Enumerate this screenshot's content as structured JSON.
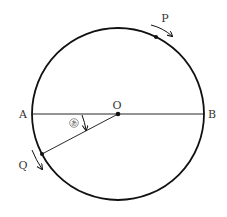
{
  "diagram": {
    "type": "circle-motion",
    "colors": {
      "stroke": "#111111",
      "label": "#333333",
      "background": "#ffffff"
    },
    "circle": {
      "cx": 118,
      "cy": 114,
      "r": 86
    },
    "center": {
      "label": "O",
      "x": 118,
      "y": 114
    },
    "points": {
      "A": {
        "label": "A",
        "x": 32,
        "y": 114
      },
      "B": {
        "label": "B",
        "x": 204,
        "y": 114
      },
      "P": {
        "label": "P",
        "x": 157,
        "y": 37,
        "direction": "clockwise"
      },
      "Q": {
        "label": "Q",
        "x": 42,
        "y": 154,
        "direction": "counterclockwise"
      }
    },
    "segments": [
      {
        "from": "A",
        "to": "B"
      },
      {
        "from": "O",
        "to": "Q"
      }
    ],
    "angle": {
      "symbol": "あ",
      "between": [
        "OA",
        "OQ"
      ],
      "vertex": "O"
    }
  }
}
